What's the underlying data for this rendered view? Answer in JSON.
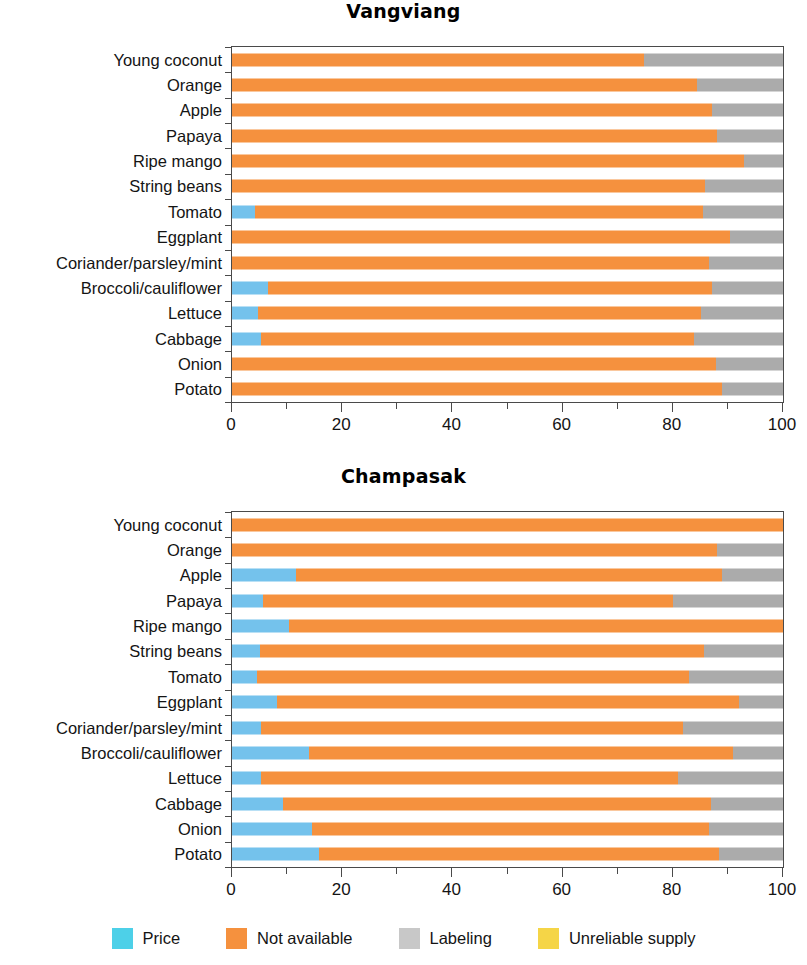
{
  "figure": {
    "colors": {
      "price": "#74C2EC",
      "not_available": "#F5913E",
      "labeling": "#ABABAB",
      "unreliable_supply": "#F5D24D",
      "axis": "#4a4a4a",
      "text": "#141414"
    },
    "legend": {
      "items": [
        {
          "label": "Price",
          "color": "#4DD0E8",
          "key": "price"
        },
        {
          "label": "Not available",
          "color": "#F5913E",
          "key": "not_available"
        },
        {
          "label": "Labeling",
          "color": "#C8C8C8",
          "key": "labeling"
        },
        {
          "label": "Unreliable supply",
          "color": "#F5D547",
          "key": "unreliable_supply"
        }
      ]
    }
  },
  "chart_data": [
    {
      "type": "bar",
      "orientation": "horizontal",
      "stacked": true,
      "title": "Vangviang",
      "xlabel": "",
      "ylabel": "",
      "xlim": [
        0,
        100
      ],
      "xticks": [
        0,
        20,
        40,
        60,
        80,
        100
      ],
      "xticklabels": [
        "0",
        "20",
        "40",
        "60",
        "80",
        "100"
      ],
      "grid": false,
      "legend_position": "bottom",
      "categories": [
        "Young coconut",
        "Orange",
        "Apple",
        "Papaya",
        "Ripe mango",
        "String beans",
        "Tomato",
        "Eggplant",
        "Coriander/parsley/mint",
        "Broccoli/cauliflower",
        "Lettuce",
        "Cabbage",
        "Onion",
        "Potato"
      ],
      "series": [
        {
          "name": "Price",
          "color": "#74C2EC",
          "values": [
            0,
            0,
            0,
            0,
            0,
            0,
            4.2,
            0,
            0,
            6.5,
            4.8,
            5.2,
            0,
            0
          ]
        },
        {
          "name": "Not available",
          "color": "#F5913E",
          "values": [
            74.7,
            84.4,
            87.1,
            88.0,
            93.0,
            85.8,
            81.2,
            90.3,
            86.6,
            80.7,
            80.4,
            78.7,
            87.9,
            88.9
          ]
        },
        {
          "name": "Labeling",
          "color": "#ABABAB",
          "values": [
            25.3,
            15.6,
            12.9,
            12.0,
            7.0,
            14.2,
            14.6,
            9.7,
            13.4,
            12.8,
            14.8,
            16.1,
            12.1,
            11.1
          ]
        },
        {
          "name": "Unreliable supply",
          "color": "#F5D24D",
          "values": [
            0,
            0,
            0,
            0,
            0,
            0,
            0,
            0,
            0,
            0,
            0,
            0,
            0,
            0
          ]
        }
      ]
    },
    {
      "type": "bar",
      "orientation": "horizontal",
      "stacked": true,
      "title": "Champasak",
      "xlabel": "",
      "ylabel": "",
      "xlim": [
        0,
        100
      ],
      "xticks": [
        0,
        20,
        40,
        60,
        80,
        100
      ],
      "xticklabels": [
        "0",
        "20",
        "40",
        "60",
        "80",
        "100"
      ],
      "grid": false,
      "legend_position": "bottom",
      "categories": [
        "Young coconut",
        "Orange",
        "Apple",
        "Papaya",
        "Ripe mango",
        "String beans",
        "Tomato",
        "Eggplant",
        "Coriander/parsley/mint",
        "Broccoli/cauliflower",
        "Lettuce",
        "Cabbage",
        "Onion",
        "Potato"
      ],
      "series": [
        {
          "name": "Price",
          "color": "#74C2EC",
          "values": [
            0,
            0,
            11.7,
            5.6,
            10.4,
            5.0,
            4.5,
            8.1,
            5.2,
            14.0,
            5.3,
            9.3,
            14.5,
            15.7
          ]
        },
        {
          "name": "Not available",
          "color": "#F5913E",
          "values": [
            100.0,
            88.0,
            77.2,
            74.4,
            89.6,
            80.6,
            78.5,
            84.0,
            76.6,
            76.9,
            75.6,
            77.7,
            72.0,
            72.7
          ]
        },
        {
          "name": "Labeling",
          "color": "#ABABAB",
          "values": [
            0.0,
            12.0,
            11.1,
            20.0,
            0.0,
            14.4,
            17.0,
            7.9,
            18.2,
            9.1,
            19.1,
            13.0,
            13.5,
            11.6
          ]
        },
        {
          "name": "Unreliable supply",
          "color": "#F5D24D",
          "values": [
            0,
            0,
            0,
            0,
            0,
            0,
            0,
            0,
            0,
            0,
            0,
            0,
            0,
            0
          ]
        }
      ]
    }
  ]
}
